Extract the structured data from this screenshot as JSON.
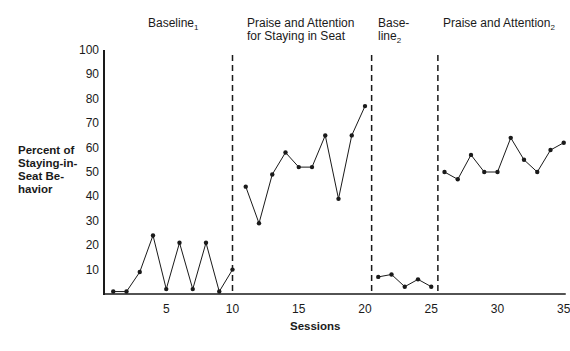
{
  "chart_data": {
    "type": "line",
    "title": "",
    "xlabel": "Sessions",
    "ylabel": "Percent of Staying-in-Seat Behavior",
    "ylim": [
      0,
      100
    ],
    "xlim": [
      0,
      35
    ],
    "yticks": [
      10,
      20,
      30,
      40,
      50,
      60,
      70,
      80,
      90,
      100
    ],
    "xticks": [
      5,
      10,
      15,
      20,
      25,
      30,
      35
    ],
    "grid": false,
    "phase_lines": [
      10,
      20.5,
      25.5
    ],
    "phases": [
      {
        "name": "Baseline1",
        "label": "Baseline",
        "sub": "1",
        "x": [
          1,
          2,
          3,
          4,
          5,
          6,
          7,
          8,
          9,
          10
        ],
        "values": [
          1,
          1,
          9,
          24,
          2,
          21,
          2,
          21,
          1,
          10
        ]
      },
      {
        "name": "Praise and Attention for Staying in Seat",
        "label": "Praise and Attention for Staying in Seat",
        "sub": "",
        "x": [
          11,
          12,
          13,
          14,
          15,
          16,
          17,
          18,
          19,
          20
        ],
        "values": [
          44,
          29,
          49,
          58,
          52,
          52,
          65,
          39,
          65,
          77
        ]
      },
      {
        "name": "Baseline2",
        "label": "Base-line",
        "sub": "2",
        "x": [
          21,
          22,
          23,
          24,
          25
        ],
        "values": [
          7,
          8,
          3,
          6,
          3
        ]
      },
      {
        "name": "Praise and Attention2",
        "label": "Praise and Attention",
        "sub": "2",
        "x": [
          26,
          27,
          28,
          29,
          30,
          31,
          32,
          33,
          34,
          35
        ],
        "values": [
          50,
          47,
          57,
          50,
          50,
          64,
          55,
          50,
          59,
          62
        ]
      }
    ]
  },
  "labels": {
    "phase1": "Baseline",
    "phase1_sub": "1",
    "phase2_line1": "Praise and Attention",
    "phase2_line2": "for Staying in Seat",
    "phase3_line1": "Base-",
    "phase3_line2": "line",
    "phase3_sub": "2",
    "phase4": "Praise and Attention",
    "phase4_sub": "2",
    "ylabel_lines": [
      "Percent of",
      "Staying-in-",
      "Seat Be-",
      "havior"
    ],
    "xlabel": "Sessions"
  }
}
